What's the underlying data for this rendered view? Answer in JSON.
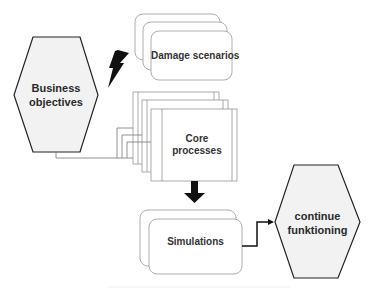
{
  "diagram": {
    "nodes": {
      "business_objectives": {
        "label_line1": "Business",
        "label_line2": "objectives",
        "shape": "hexagon"
      },
      "damage_scenarios": {
        "label": "Damage scenarios",
        "shape": "stacked-rounded-rectangles"
      },
      "core_processes": {
        "label_line1": "Core",
        "label_line2": "processes",
        "shape": "stacked-rectangles"
      },
      "simulations": {
        "label": "Simulations",
        "shape": "stacked-rounded-rectangles"
      },
      "continue_functioning": {
        "label_line1": "continue",
        "label_line2": "funktioning",
        "shape": "hexagon"
      }
    },
    "edges": [
      {
        "from": "damage_scenarios",
        "to": "business_objectives",
        "type": "lightning-bolt"
      },
      {
        "from": "business_objectives",
        "to": "core_processes",
        "type": "elbow-connector"
      },
      {
        "from": "core_processes",
        "to": "simulations",
        "type": "block-arrow-down"
      },
      {
        "from": "simulations",
        "to": "continue_functioning",
        "type": "elbow-arrow"
      }
    ],
    "colors": {
      "hexagon_fill": "#f2f2f2",
      "stroke": "#222222",
      "box_stroke": "#888888",
      "arrow": "#111111"
    }
  }
}
